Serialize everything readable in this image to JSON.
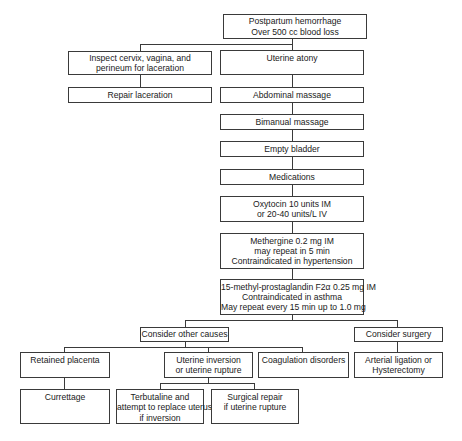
{
  "diagram": {
    "nodes": {
      "root": [
        "Postpartum hemorrhage",
        "Over 500 cc blood loss"
      ],
      "inspect": [
        "Inspect cervix, vagina, and",
        "perineum for laceration"
      ],
      "repair": [
        "Repair laceration"
      ],
      "atony": [
        "Uterine atony"
      ],
      "abdominal": [
        "Abdominal massage"
      ],
      "bimanual": [
        "Bimanual massage"
      ],
      "bladder": [
        "Empty bladder"
      ],
      "medications": [
        "Medications"
      ],
      "oxytocin": [
        "Oxytocin 10 units IM",
        "or 20-40 units/L IV"
      ],
      "methergine": [
        "Methergine 0.2 mg IM",
        "may repeat in 5 min",
        "Contraindicated in hypertension"
      ],
      "prostaglandin": [
        "15-methyl-prostaglandin F2α 0.25 mg IM",
        "Contraindicated in asthma",
        "May repeat every 15 min up to 1.0 mg"
      ],
      "other_causes": [
        "Consider other causes"
      ],
      "surgery": [
        "Consider surgery"
      ],
      "retained": [
        "Retained placenta"
      ],
      "inversion": [
        "Uterine inversion",
        "or uterine rupture"
      ],
      "coagulation": [
        "Coagulation disorders"
      ],
      "arterial": [
        "Arterial ligation or",
        "Hysterectomy"
      ],
      "curettage": [
        "Currettage"
      ],
      "terbutaline": [
        "Terbutaline and",
        "attempt to replace uterus",
        "if inversion"
      ],
      "surgical_repair": [
        "Surgical repair",
        "if uterine rupture"
      ]
    },
    "edges": [
      [
        "root",
        "inspect"
      ],
      [
        "root",
        "atony"
      ],
      [
        "inspect",
        "repair"
      ],
      [
        "atony",
        "abdominal"
      ],
      [
        "abdominal",
        "bimanual"
      ],
      [
        "bimanual",
        "bladder"
      ],
      [
        "bladder",
        "medications"
      ],
      [
        "medications",
        "oxytocin"
      ],
      [
        "oxytocin",
        "methergine"
      ],
      [
        "methergine",
        "prostaglandin"
      ],
      [
        "prostaglandin",
        "other_causes"
      ],
      [
        "prostaglandin",
        "surgery"
      ],
      [
        "other_causes",
        "retained"
      ],
      [
        "other_causes",
        "inversion"
      ],
      [
        "other_causes",
        "coagulation"
      ],
      [
        "surgery",
        "arterial"
      ],
      [
        "retained",
        "curettage"
      ],
      [
        "inversion",
        "terbutaline"
      ],
      [
        "inversion",
        "surgical_repair"
      ]
    ]
  }
}
